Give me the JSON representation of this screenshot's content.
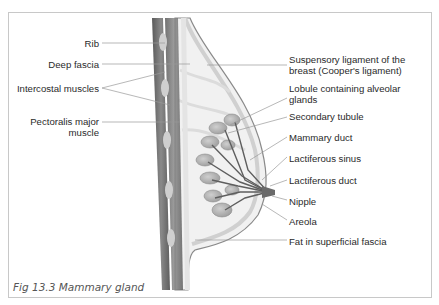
{
  "figure": {
    "caption": "Fig 13.3 Mammary gland"
  },
  "labels_left": {
    "rib": "Rib",
    "deep_fascia": "Deep fascia",
    "intercostal_muscles": "Intercostal muscles",
    "pectoralis_major_line1": "Pectoralis major",
    "pectoralis_major_line2": "muscle"
  },
  "labels_right": {
    "suspensory_line1": "Suspensory ligament of the",
    "suspensory_line2": "breast (Cooper's ligament)",
    "lobule_line1": "Lobule containing alveolar",
    "lobule_line2": "glands",
    "secondary_tubule": "Secondary tubule",
    "mammary_duct": "Mammary duct",
    "lactiferous_sinus": "Lactiferous sinus",
    "lactiferous_duct": "Lactiferous duct",
    "nipple": "Nipple",
    "areola": "Areola",
    "fat": "Fat in superficial fascia"
  },
  "colors": {
    "frame": "#c8c8c8",
    "muscle": "#6e6e6e",
    "tissue": "#d9d9d9",
    "leader": "#9a9a9a"
  }
}
